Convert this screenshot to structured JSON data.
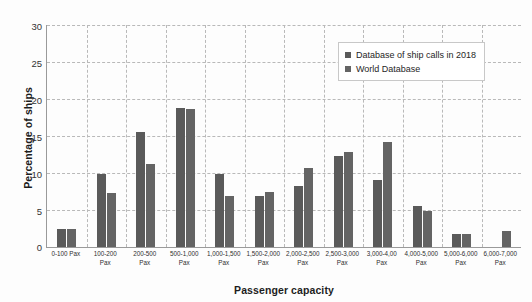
{
  "chart_data": {
    "type": "bar",
    "title": "",
    "xlabel": "Passenger capacity",
    "ylabel": "Percentage of ships",
    "ylim": [
      0,
      30
    ],
    "yticks": [
      0,
      5,
      10,
      15,
      20,
      25,
      30
    ],
    "grid": true,
    "legend_position": "top-right",
    "categories": [
      "0-100 Pax",
      "100-200 Pax",
      "200-500 Pax",
      "500-1,000 Pax",
      "1,000-1,500 Pax",
      "1,500-2,000 Pax",
      "2,000-2,500 Pax",
      "2,500-3,000 Pax",
      "3,000-4,00 Pax",
      "4,000-5,000 Pax",
      "5,000-6,000 Pax",
      "6,000-7,000 Pax"
    ],
    "series": [
      {
        "name": "Database of ship calls in 2018",
        "color": "#5a5a5a",
        "values": [
          2.5,
          9.9,
          15.5,
          18.8,
          9.9,
          6.9,
          8.3,
          12.3,
          9.0,
          5.6,
          1.7,
          0
        ]
      },
      {
        "name": "World Database",
        "color": "#646464",
        "values": [
          2.5,
          7.3,
          11.2,
          18.6,
          6.9,
          7.5,
          10.7,
          12.8,
          14.2,
          4.9,
          1.7,
          2.1
        ]
      }
    ]
  },
  "axes": {
    "y_title": "Percentage of ships",
    "x_title": "Passenger capacity"
  }
}
